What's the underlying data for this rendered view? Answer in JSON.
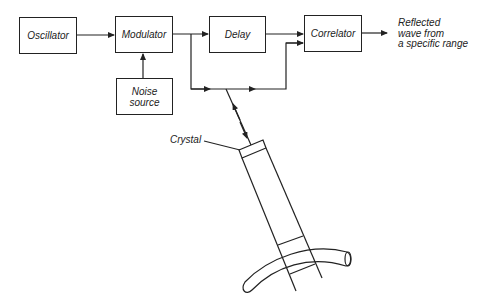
{
  "diagram": {
    "blocks": {
      "oscillator": "Oscillator",
      "modulator": "Modulator",
      "delay": "Delay",
      "correlator": "Correlator",
      "noise_line1": "Noise",
      "noise_line2": "source"
    },
    "output_label": {
      "line1": "Reflected",
      "line2": "wave from",
      "line3": "a specific range"
    },
    "crystal_label": "Crystal",
    "colors": {
      "line": "#222222",
      "background": "#ffffff"
    }
  }
}
